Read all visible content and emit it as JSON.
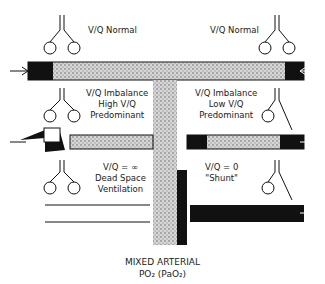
{
  "diagram": {
    "top_caption_cut": "",
    "colors": {
      "ink": "#1a1a1a",
      "stipple": "#b8b8b8",
      "bg": "#ffffff"
    },
    "quadrants": [
      {
        "id": "top-left",
        "lines": [
          "V/Q Normal"
        ]
      },
      {
        "id": "top-right",
        "lines": [
          "V/Q Normal"
        ]
      },
      {
        "id": "mid-left",
        "lines": [
          "V/Q Imbalance",
          "High V/Q",
          "Predominant"
        ]
      },
      {
        "id": "mid-right",
        "lines": [
          "V/Q Imbalance",
          "Low V/Q",
          "Predominant"
        ]
      },
      {
        "id": "bottom-left",
        "lines": [
          "V/Q = ∞",
          "Dead Space",
          "Ventilation"
        ]
      },
      {
        "id": "bottom-right",
        "lines": [
          "V/Q = 0",
          "\"Shunt\""
        ]
      }
    ],
    "bottom_label": {
      "line1": "MIXED ARTERIAL",
      "line2": "PO₂ (PaO₂)"
    }
  }
}
